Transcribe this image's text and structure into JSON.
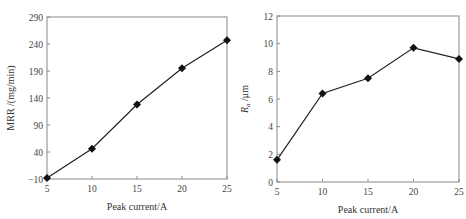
{
  "chart_data": [
    {
      "type": "line",
      "title": "",
      "xlabel": "Peak current/A",
      "ylabel": "MRR /(mg/min)",
      "x": [
        5,
        10,
        15,
        20,
        25
      ],
      "series": [
        {
          "name": "MRR",
          "values": [
            -8,
            46,
            128,
            195,
            247
          ]
        }
      ],
      "xticks": [
        5,
        10,
        15,
        20,
        25
      ],
      "yticks": [
        -10,
        40,
        90,
        140,
        190,
        240,
        290
      ],
      "xlim": [
        5,
        25
      ],
      "ylim": [
        -10,
        290
      ],
      "marker": "diamond",
      "grid": false,
      "legend": null
    },
    {
      "type": "line",
      "title": "",
      "xlabel": "Peak current/A",
      "ylabel": "Ra /μm",
      "ylabel_main": "R",
      "ylabel_sub": "a",
      "ylabel_unit": "/μm",
      "x": [
        5,
        10,
        15,
        20,
        25
      ],
      "series": [
        {
          "name": "Ra",
          "values": [
            1.6,
            6.4,
            7.5,
            9.7,
            8.9
          ]
        }
      ],
      "xticks": [
        5,
        10,
        15,
        20,
        25
      ],
      "yticks": [
        0,
        2,
        4,
        6,
        8,
        10,
        12
      ],
      "xlim": [
        5,
        25
      ],
      "ylim": [
        0,
        12
      ],
      "marker": "diamond",
      "grid": false,
      "legend": null
    }
  ]
}
